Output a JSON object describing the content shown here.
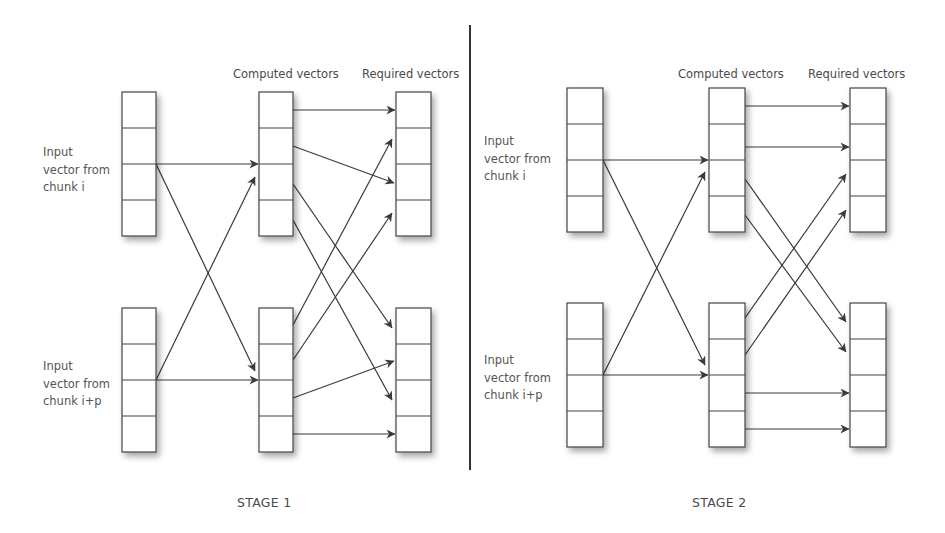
{
  "stages": [
    {
      "title": "STAGE 1",
      "headers": {
        "computed": "Computed vectors",
        "required": "Required vectors"
      },
      "inputs": [
        {
          "lines": [
            "Input",
            "vector from",
            "chunk i"
          ]
        },
        {
          "lines": [
            "Input",
            "vector from",
            "chunk i+p"
          ]
        }
      ],
      "cells_per_vector": 4
    },
    {
      "title": "STAGE 2",
      "headers": {
        "computed": "Computed vectors",
        "required": "Required vectors"
      },
      "inputs": [
        {
          "lines": [
            "Input",
            "vector from",
            "chunk i"
          ]
        },
        {
          "lines": [
            "Input",
            "vector from",
            "chunk i+p"
          ]
        }
      ],
      "cells_per_vector": 4
    }
  ],
  "colors": {
    "line": "#3a3a3a",
    "box_border": "#444444",
    "shadow": "#bdbdbd",
    "text": "#555555",
    "divider": "#333333"
  }
}
